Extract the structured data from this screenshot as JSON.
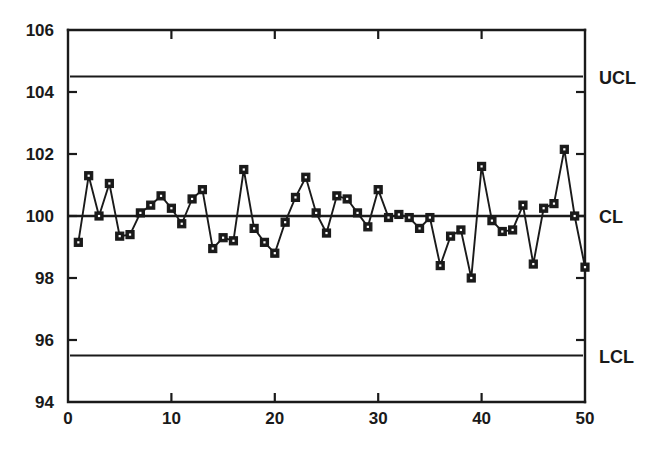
{
  "chart_data": {
    "type": "line",
    "title": "",
    "subtitle": "",
    "xlabel": "",
    "ylabel": "",
    "xlim": [
      0,
      50
    ],
    "ylim": [
      94,
      106
    ],
    "grid": false,
    "legend_position": "right-outside",
    "x_ticks": [
      0,
      10,
      20,
      30,
      40,
      50
    ],
    "x_tick_labels": [
      "0",
      "10",
      "20",
      "30",
      "40",
      "50"
    ],
    "x_minor_ticks": [
      5,
      15,
      25,
      35,
      45
    ],
    "y_ticks": [
      94,
      96,
      98,
      100,
      102,
      104,
      106
    ],
    "y_tick_labels": [
      "94",
      "96",
      "98",
      "100",
      "102",
      "104",
      "106"
    ],
    "control_limits": [
      {
        "name": "UCL",
        "label": "UCL",
        "value": 104.5
      },
      {
        "name": "CL",
        "label": "CL",
        "value": 100.0
      },
      {
        "name": "LCL",
        "label": "LCL",
        "value": 95.5
      }
    ],
    "series": [
      {
        "name": "Individual Measurement",
        "marker": "filled-square",
        "x": [
          1,
          2,
          3,
          4,
          5,
          6,
          7,
          8,
          9,
          10,
          11,
          12,
          13,
          14,
          15,
          16,
          17,
          18,
          19,
          20,
          21,
          22,
          23,
          24,
          25,
          26,
          27,
          28,
          29,
          30,
          31,
          32,
          33,
          34,
          35,
          36,
          37,
          38,
          39,
          40,
          41,
          42,
          43,
          44,
          45,
          46,
          47,
          48,
          49,
          50
        ],
        "values": [
          99.15,
          101.3,
          100.0,
          101.05,
          99.35,
          99.4,
          100.1,
          100.35,
          100.65,
          100.25,
          99.75,
          100.55,
          100.85,
          98.95,
          99.3,
          99.2,
          101.5,
          99.6,
          99.15,
          98.8,
          99.8,
          100.6,
          101.25,
          100.1,
          99.45,
          100.65,
          100.55,
          100.1,
          99.65,
          100.85,
          99.95,
          100.05,
          99.95,
          99.6,
          99.95,
          98.4,
          99.35,
          99.55,
          98.0,
          101.6,
          99.85,
          99.5,
          99.55,
          100.35,
          98.45,
          100.25,
          100.4,
          102.15,
          100.0,
          98.35
        ]
      }
    ]
  }
}
